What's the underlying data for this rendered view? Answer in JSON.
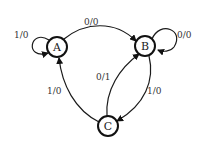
{
  "diagram": {
    "type": "state-machine",
    "nodes": [
      {
        "id": "A",
        "label": "A"
      },
      {
        "id": "B",
        "label": "B"
      },
      {
        "id": "C",
        "label": "C"
      }
    ],
    "edges": [
      {
        "from": "A",
        "to": "A",
        "label": "1/0"
      },
      {
        "from": "A",
        "to": "B",
        "label": "0/0"
      },
      {
        "from": "B",
        "to": "B",
        "label": "0/0"
      },
      {
        "from": "C",
        "to": "B",
        "label": "0/1"
      },
      {
        "from": "B",
        "to": "C",
        "label": "1/0"
      },
      {
        "from": "C",
        "to": "A",
        "label": "1/0"
      }
    ],
    "colors": {
      "stroke": "#111111",
      "background": "#ffffff"
    }
  }
}
